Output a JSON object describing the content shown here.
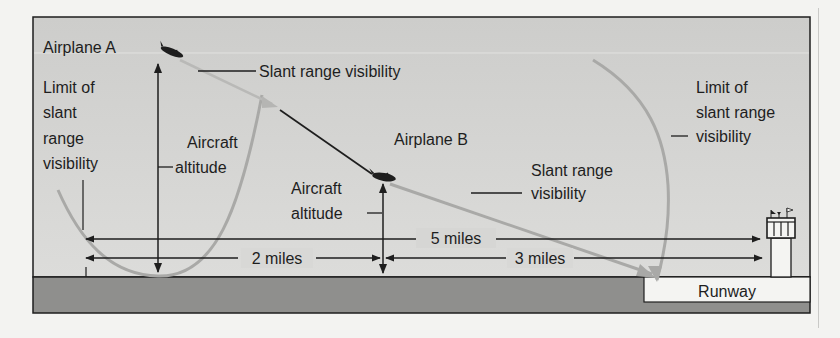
{
  "figure": {
    "labels": {
      "airplane_a": "Airplane A",
      "airplane_b": "Airplane B",
      "slant_range_top": "Slant range visibility",
      "limit_left": [
        "Limit of",
        "slant",
        "range",
        "visibility"
      ],
      "aircraft_altitude_a": [
        "Aircraft",
        "altitude"
      ],
      "aircraft_altitude_b": [
        "Aircraft",
        "altitude"
      ],
      "slant_range_right": [
        "Slant range",
        "visibility"
      ],
      "limit_right": [
        "Limit of",
        "slant range",
        "visibility"
      ],
      "five_miles": "5 miles",
      "two_miles": "2 miles",
      "three_miles": "3 miles",
      "runway": "Runway"
    },
    "colors": {
      "sky": "#d4d4d2",
      "ground": "#8f8f8d",
      "runway": "#f4f4f2",
      "line": "#1e1e1e",
      "visibility_arc": "#a9a9a7"
    },
    "icons": {
      "airplane_a": "airplane-icon",
      "airplane_b": "airplane-icon",
      "control_tower": "control-tower-icon"
    }
  }
}
